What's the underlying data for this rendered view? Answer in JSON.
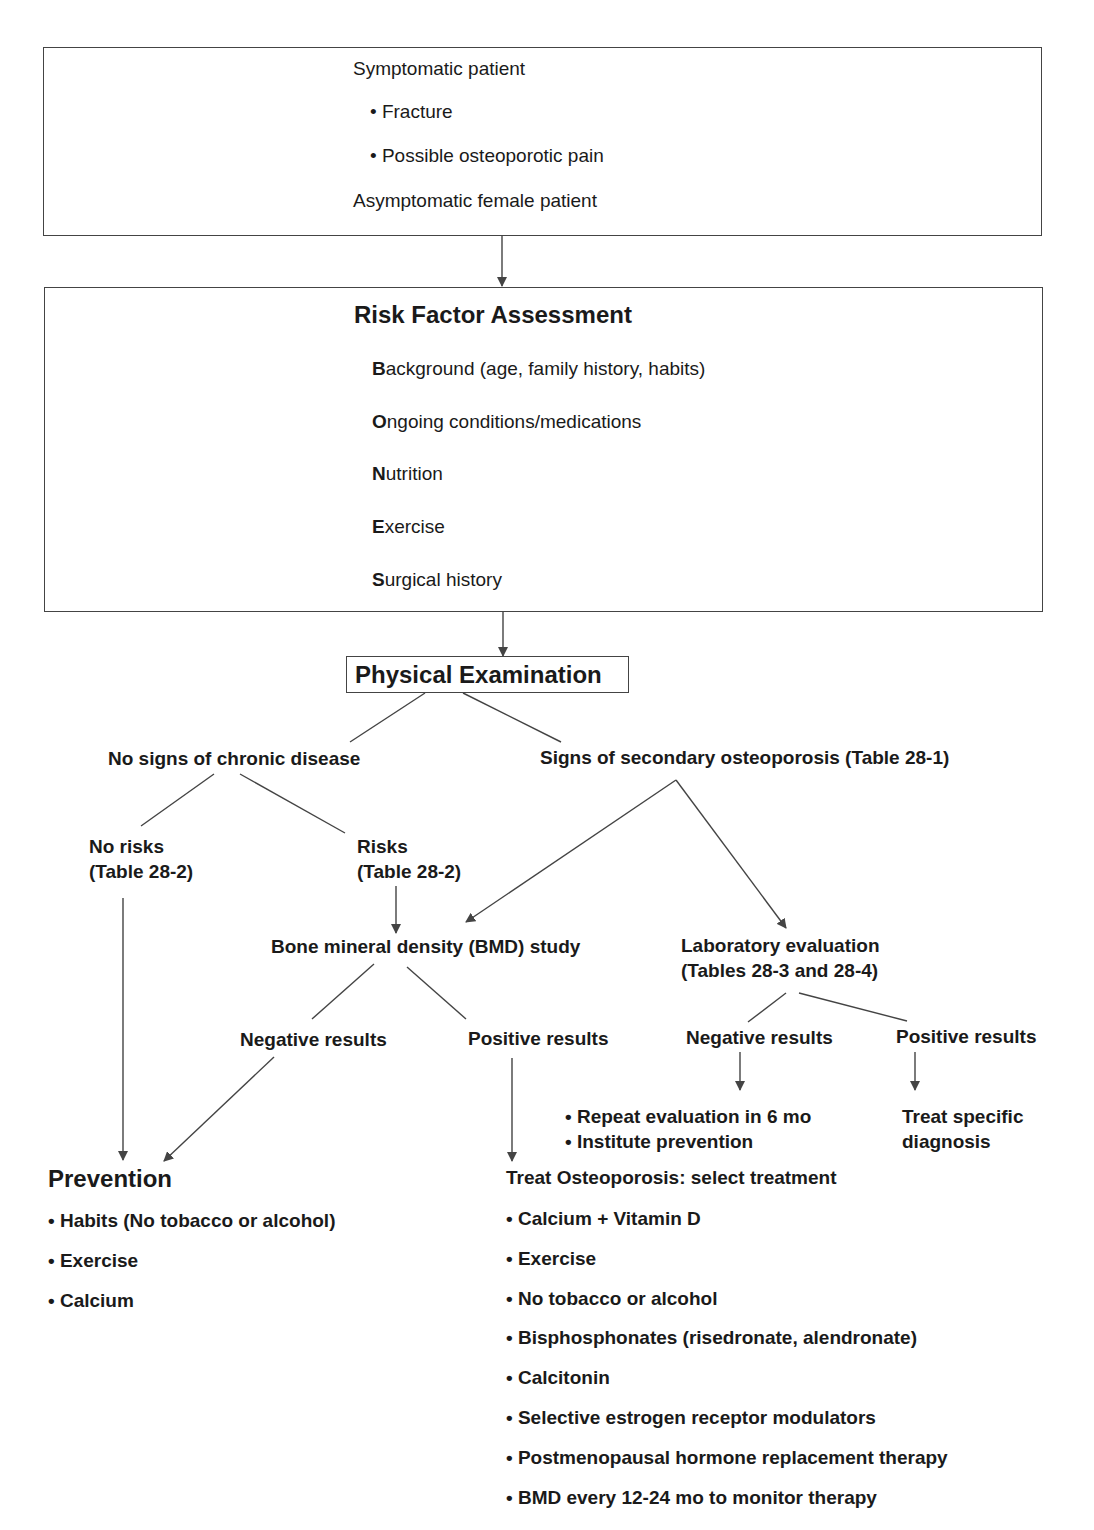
{
  "presentation": {
    "symptomatic_label": "Symptomatic patient",
    "symptoms": [
      "Fracture",
      "Possible osteoporotic pain"
    ],
    "asymptomatic_label": "Asymptomatic female patient"
  },
  "risk_assessment": {
    "title": "Risk Factor Assessment",
    "items": [
      {
        "initial": "B",
        "rest": "ackground (age, family history, habits)"
      },
      {
        "initial": "O",
        "rest": "ngoing conditions/medications"
      },
      {
        "initial": "N",
        "rest": "utrition"
      },
      {
        "initial": "E",
        "rest": "xercise"
      },
      {
        "initial": "S",
        "rest": "urgical history"
      }
    ]
  },
  "physical_exam": {
    "title": "Physical Examination"
  },
  "branches": {
    "no_chronic": "No signs of chronic disease",
    "secondary": "Signs of secondary osteoporosis (Table 28-1)",
    "no_risks": [
      "No risks",
      "(Table 28-2)"
    ],
    "risks": [
      "Risks",
      "(Table 28-2)"
    ],
    "bmd_study": "Bone mineral density (BMD) study",
    "lab_eval": [
      "Laboratory evaluation",
      "(Tables 28-3 and 28-4)"
    ],
    "bmd_negative": "Negative results",
    "bmd_positive": "Positive results",
    "lab_negative": "Negative results",
    "lab_positive": "Positive results",
    "lab_negative_actions": [
      "Repeat evaluation in 6 mo",
      "Institute prevention"
    ],
    "lab_positive_action": [
      "Treat specific",
      "diagnosis"
    ]
  },
  "prevention": {
    "title": "Prevention",
    "items": [
      "Habits (No tobacco or alcohol)",
      "Exercise",
      "Calcium"
    ]
  },
  "treatment": {
    "title": "Treat Osteoporosis: select treatment",
    "items": [
      "Calcium + Vitamin D",
      "Exercise",
      "No tobacco or alcohol",
      "Bisphosphonates (risedronate, alendronate)",
      "Calcitonin",
      "Selective estrogen receptor modulators",
      "Postmenopausal hormone replacement therapy",
      "BMD every 12-24 mo to monitor therapy"
    ]
  },
  "bullet": "•",
  "colors": {
    "line": "#444444",
    "text": "#1a1a1a",
    "background": "#ffffff"
  }
}
